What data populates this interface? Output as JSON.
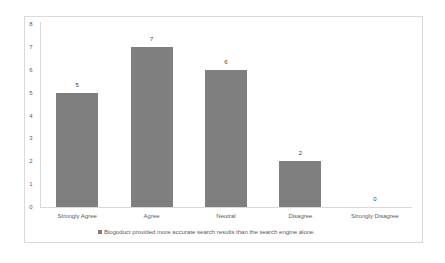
{
  "chart_data": {
    "type": "bar",
    "title": "",
    "xlabel": "",
    "ylabel": "",
    "categories": [
      "Strongly Agree",
      "Agree",
      "Neutral",
      "Disagree",
      "Strongly Disagree"
    ],
    "series": [
      {
        "name": "Blogoduct provided more accurate search results than the search engine alone.",
        "values": [
          5,
          7,
          6,
          2,
          0
        ],
        "color": "#7f7f7f"
      }
    ],
    "data_labels": [
      "5",
      "7",
      "6",
      "2",
      "0"
    ],
    "ylim": [
      0,
      8
    ],
    "yticks": [
      "0",
      "1",
      "2",
      "3",
      "4",
      "5",
      "6",
      "7",
      "8"
    ],
    "grid": false,
    "legend_position": "bottom"
  },
  "legend": {
    "label": "Blogoduct provided more accurate search results than the search engine alone."
  }
}
